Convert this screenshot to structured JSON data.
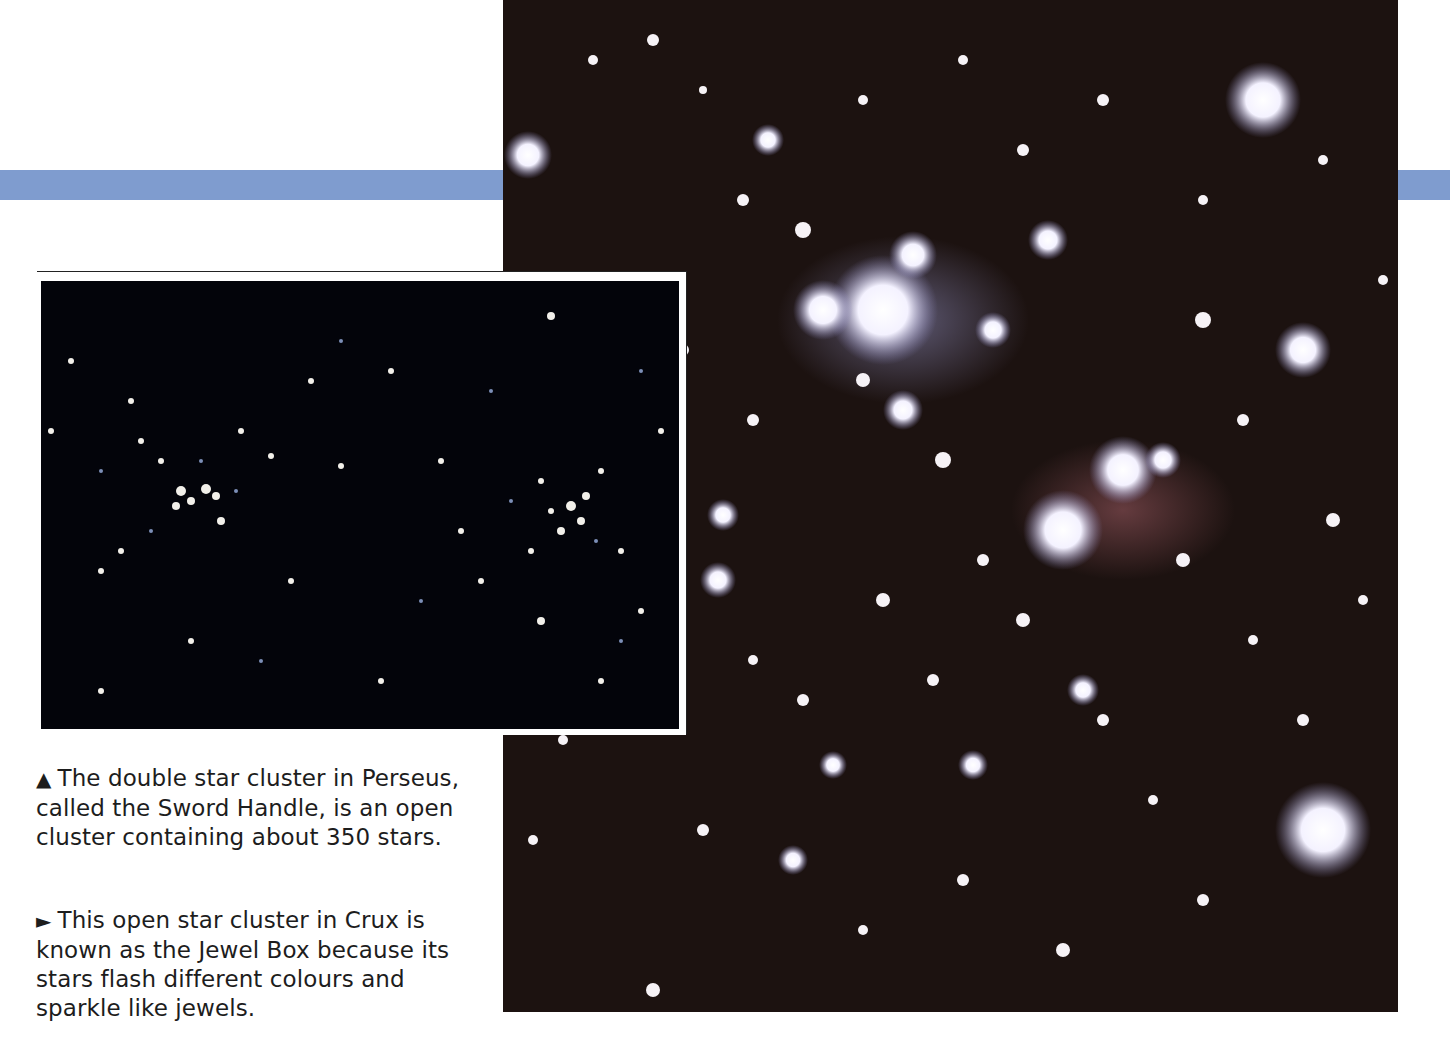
{
  "page": {
    "accent_band_color": "#7f9ccf"
  },
  "main_photo": {
    "subject": "Jewel Box open star cluster in Crux",
    "icon": "starfield-photo"
  },
  "inset_photo": {
    "subject": "Double star cluster in Perseus (Sword Handle)",
    "icon": "starfield-photo"
  },
  "captions": [
    {
      "glyph": "▲",
      "glyph_icon": "triangle-up-icon",
      "text": "The double star cluster in Perseus, called the Sword Handle, is an open cluster containing about 350 stars."
    },
    {
      "glyph": "►",
      "glyph_icon": "triangle-right-icon",
      "text": "This open star cluster in Crux is known as the Jewel Box because its stars flash different colours and sparkle like jewels."
    }
  ]
}
